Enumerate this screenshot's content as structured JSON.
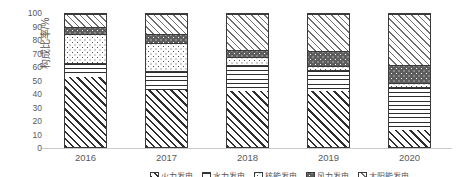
{
  "chart_data": {
    "type": "bar",
    "subtype": "stacked-percentage",
    "title": "",
    "xlabel": "",
    "ylabel": "构成比率/%",
    "ylim": [
      0,
      100
    ],
    "yticks": [
      100,
      90,
      80,
      70,
      60,
      50,
      40,
      30,
      20,
      10,
      0
    ],
    "grid": false,
    "legend_position": "bottom",
    "categories": [
      "2016",
      "2017",
      "2018",
      "2019",
      "2020"
    ],
    "series": [
      {
        "name": "火力发电",
        "pattern": "diagonal-hatch",
        "values": [
          53,
          43,
          42,
          42,
          13
        ]
      },
      {
        "name": "水力发电",
        "pattern": "horizontal-line",
        "values": [
          10,
          14,
          20,
          16,
          32
        ]
      },
      {
        "name": "核能发电",
        "pattern": "sparse-dots",
        "values": [
          22,
          21,
          6,
          3,
          3
        ]
      },
      {
        "name": "风力发电",
        "pattern": "dark-speckle",
        "values": [
          5,
          7,
          5,
          11,
          14
        ]
      },
      {
        "name": "太阳能发电",
        "pattern": "light-hatch",
        "values": [
          10,
          15,
          27,
          28,
          38
        ]
      }
    ]
  },
  "axis": {
    "y_label": "构成比率/%",
    "y_ticks": [
      "100",
      "90",
      "80",
      "70",
      "60",
      "50",
      "40",
      "30",
      "20",
      "10",
      "0"
    ],
    "x_ticks": [
      "2016",
      "2017",
      "2018",
      "2019",
      "2020"
    ]
  },
  "legend": {
    "items": [
      "火力发电",
      "水力发电",
      "核能发电",
      "风力发电",
      "太阳能发电"
    ]
  }
}
